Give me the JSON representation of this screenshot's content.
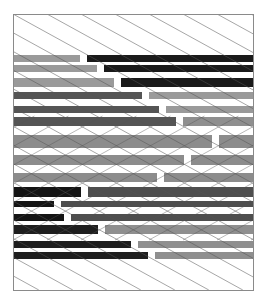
{
  "artwork": {
    "title": "",
    "background": "#ffffff",
    "frame": {
      "x": 13,
      "y": 14,
      "width": 240,
      "height": 276,
      "stroke": "#8a8a8a"
    },
    "line_color": "#555555",
    "line_spacing": 34,
    "line_slope": 0.55,
    "fold_y_top": 136,
    "fold_y_bottom": 200,
    "gap": 7,
    "rows": [
      {
        "y": 55,
        "h": 7,
        "split": 80,
        "left": "#9a9a9a",
        "right": "#1a1a1a"
      },
      {
        "y": 65,
        "h": 7,
        "split": 97,
        "left": "#9a9a9a",
        "right": "#1a1a1a"
      },
      {
        "y": 78,
        "h": 9,
        "split": 114,
        "left": "#9a9a9a",
        "right": "#1a1a1a"
      },
      {
        "y": 92,
        "h": 7,
        "split": 142,
        "left": "#555555",
        "right": "#9a9a9a"
      },
      {
        "y": 106,
        "h": 7,
        "split": 159,
        "left": "#555555",
        "right": "#9a9a9a"
      },
      {
        "y": 117,
        "h": 9,
        "split": 176,
        "left": "#555555",
        "right": "#8f8f8f"
      },
      {
        "y": 135,
        "h": 13,
        "split": 212,
        "left": "#8c8c8c",
        "right": "#8c8c8c"
      },
      {
        "y": 155,
        "h": 10,
        "split": 184,
        "left": "#8c8c8c",
        "right": "#8c8c8c"
      },
      {
        "y": 173,
        "h": 9,
        "split": 157,
        "left": "#8c8c8c",
        "right": "#8c8c8c"
      },
      {
        "y": 187,
        "h": 10,
        "split": 81,
        "left": "#141414",
        "right": "#4e4e4e"
      },
      {
        "y": 201,
        "h": 6,
        "split": 54,
        "left": "#141414",
        "right": "#4e4e4e"
      },
      {
        "y": 214,
        "h": 7,
        "split": 64,
        "left": "#141414",
        "right": "#4e4e4e"
      },
      {
        "y": 225,
        "h": 9,
        "split": 98,
        "left": "#1e1e1e",
        "right": "#8f8f8f"
      },
      {
        "y": 241,
        "h": 7,
        "split": 131,
        "left": "#1e1e1e",
        "right": "#8f8f8f"
      },
      {
        "y": 252,
        "h": 7,
        "split": 148,
        "left": "#1e1e1e",
        "right": "#8f8f8f"
      }
    ]
  }
}
